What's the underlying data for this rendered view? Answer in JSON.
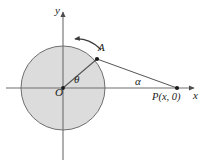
{
  "figure": {
    "kind": "geometry-diagram",
    "background_color": "#ffffff",
    "circle_fill_color": "#dcdcdc",
    "stroke_color": "#595959",
    "label_color": "#1a1a1a"
  },
  "labels": {
    "y_axis": "y",
    "x_axis": "x",
    "origin": "O",
    "point_on_circle": "A",
    "angle_theta": "θ",
    "angle_alpha": "α",
    "point_p": "P(x, 0)"
  },
  "geometry": {
    "circle": {
      "cx": 63,
      "cy": 88,
      "r": 42
    },
    "point_A": {
      "x": 97,
      "y": 59
    },
    "point_P": {
      "x": 177,
      "y": 88
    },
    "y_axis": {
      "x": 63,
      "top": 8,
      "bottom": 160
    },
    "x_axis": {
      "y": 88,
      "left": 6,
      "right": 197
    },
    "rotation_arrow": "counterclockwise"
  }
}
